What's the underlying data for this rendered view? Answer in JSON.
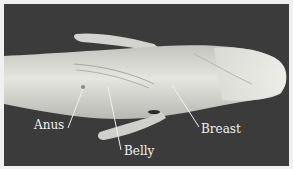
{
  "figure": {
    "background_color": "#3b3b3b",
    "body_color": "#d8d8d2",
    "labels": [
      {
        "id": "anus",
        "text": "Anus"
      },
      {
        "id": "belly",
        "text": "Belly"
      },
      {
        "id": "breast",
        "text": "Breast"
      }
    ]
  }
}
